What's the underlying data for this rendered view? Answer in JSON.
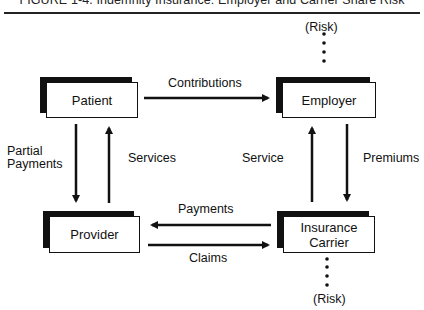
{
  "figure": {
    "title": "FIGURE 1-4. Indemnity Insurance: Employer and Carrier Share Risk"
  },
  "nodes": {
    "patient": {
      "label": "Patient"
    },
    "employer": {
      "label": "Employer"
    },
    "provider": {
      "label": "Provider"
    },
    "carrier": {
      "label_line1": "Insurance",
      "label_line2": "Carrier"
    }
  },
  "risk_markers": {
    "top": "(Risk)",
    "bottom": "(Risk)"
  },
  "edges": [
    {
      "from": "Patient",
      "to": "Employer",
      "label": "Contributions"
    },
    {
      "from": "Patient",
      "to": "Provider",
      "label_line1": "Partial",
      "label_line2": "Payments"
    },
    {
      "from": "Provider",
      "to": "Patient",
      "label": "Services"
    },
    {
      "from": "Insurance Carrier",
      "to": "Employer",
      "label": "Service"
    },
    {
      "from": "Employer",
      "to": "Insurance Carrier",
      "label": "Premiums"
    },
    {
      "from": "Insurance Carrier",
      "to": "Provider",
      "label": "Payments"
    },
    {
      "from": "Provider",
      "to": "Insurance Carrier",
      "label": "Claims"
    }
  ],
  "colors": {
    "ink": "#111111",
    "background": "#ffffff"
  }
}
